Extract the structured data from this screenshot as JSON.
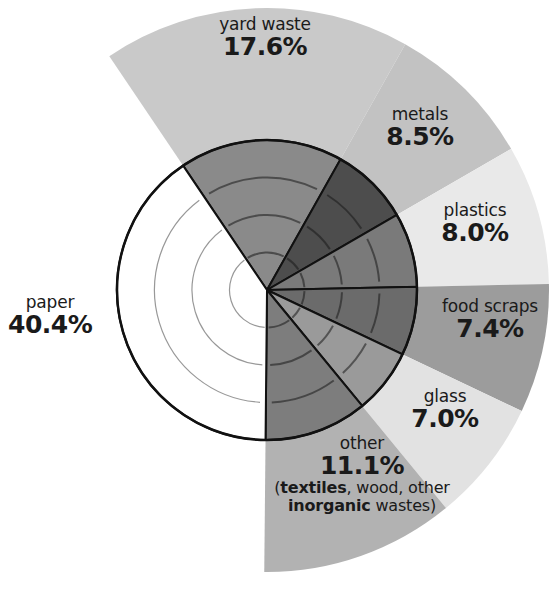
{
  "chart_data": {
    "type": "pie",
    "title": "",
    "unit": "%",
    "center": [
      267,
      290
    ],
    "inner_radius": 150,
    "outer_radius": 282,
    "start_angle_deg": 326,
    "slices": [
      {
        "key": "yard",
        "label": "yard waste",
        "value": 17.6,
        "display": "17.6%",
        "color": "#c9c9c9",
        "inner": "#8a8a8a"
      },
      {
        "key": "metals",
        "label": "metals",
        "value": 8.5,
        "display": "8.5%",
        "color": "#c2c2c2",
        "inner": "#4d4d4d"
      },
      {
        "key": "plastics",
        "label": "plastics",
        "value": 8.0,
        "display": "8.0%",
        "color": "#e9e9e9",
        "inner": "#7a7a7a"
      },
      {
        "key": "food",
        "label": "food scraps",
        "value": 7.4,
        "display": "7.4%",
        "color": "#9c9c9c",
        "inner": "#6b6b6b"
      },
      {
        "key": "glass",
        "label": "glass",
        "value": 7.0,
        "display": "7.0%",
        "color": "#e2e2e2",
        "inner": "#9a9a9a"
      },
      {
        "key": "other",
        "label": "other",
        "value": 11.1,
        "display": "11.1%",
        "color": "#b2b2b2",
        "inner": "#7d7d7d",
        "note": {
          "open": "(",
          "bold1": "textiles",
          "mid": ", wood, other",
          "bold2": "inorganic",
          "end": " wastes)"
        }
      },
      {
        "key": "paper",
        "label": "paper",
        "value": 40.4,
        "display": "40.4%",
        "color": "#ffffff",
        "inner": "#ffffff"
      }
    ],
    "categories": [
      "yard waste",
      "metals",
      "plastics",
      "food scraps",
      "glass",
      "other",
      "paper"
    ],
    "values": [
      17.6,
      8.5,
      8.0,
      7.4,
      7.0,
      11.1,
      40.4
    ]
  },
  "labels": {
    "yard": {
      "name": "yard waste",
      "pct": "17.6%"
    },
    "metals": {
      "name": "metals",
      "pct": "8.5%"
    },
    "plastics": {
      "name": "plastics",
      "pct": "8.0%"
    },
    "food": {
      "name": "food scraps",
      "pct": "7.4%"
    },
    "glass": {
      "name": "glass",
      "pct": "7.0%"
    },
    "other": {
      "name": "other",
      "pct": "11.1%",
      "note_open": "(",
      "note_bold1": "textiles",
      "note_mid": ", wood, other",
      "note_bold2": "inorganic",
      "note_end": " wastes)"
    },
    "paper": {
      "name": "paper",
      "pct": "40.4%"
    }
  }
}
